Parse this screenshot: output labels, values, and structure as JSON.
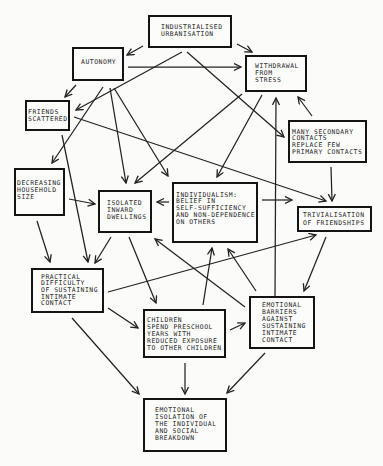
{
  "diagram": {
    "nodes": {
      "industrialised_urbanisation": {
        "label": "INDUSTRIALISED\nURBANISATION"
      },
      "autonomy": {
        "label": "AUTONOMY"
      },
      "withdrawal_from_stress": {
        "label": "WITHDRAWAL\nFROM\nSTRESS"
      },
      "friends_scattered": {
        "label": "FRIENDS\nSCATTERED"
      },
      "many_secondary_contacts": {
        "label": "MANY SECONDARY\nCONTACTS\nREPLACE FEW\nPRIMARY CONTACTS"
      },
      "decreasing_household_size": {
        "label": "DECREASING\nHOUSEHOLD\nSIZE"
      },
      "isolated_inward_dwellings": {
        "label": "ISOLATED\nINWARD\nDWELLINGS"
      },
      "individualism": {
        "label": "INDIVIDUALISM:\nBELIEF IN\nSELF-SUFFICIENCY\nAND NON-DEPENDENCE\nON OTHERS"
      },
      "trivialisation_of_friendships": {
        "label": "TRIVIALISATION\nOF FRIENDSHIPS"
      },
      "practical_difficulty": {
        "label": "PRACTICAL\nDIFFICULTY\nOF SUSTAINING\nINTIMATE\nCONTACT"
      },
      "emotional_barriers": {
        "label": "EMOTIONAL\nBARRIERS\nAGAINST\nSUSTAINING\nINTIMATE\nCONTACT"
      },
      "children_preschool": {
        "label": "CHILDREN\nSPEND PRESCHOOL\nYEARS WITH\nREDUCED EXPOSURE\nTO OTHER CHILDREN"
      },
      "emotional_isolation": {
        "label": "EMOTIONAL\nISOLATION OF\nTHE INDIVIDUAL\nAND SOCIAL\nBREAKDOWN"
      }
    },
    "edges": [
      {
        "from": "industrialised_urbanisation",
        "to": "autonomy"
      },
      {
        "from": "industrialised_urbanisation",
        "to": "withdrawal_from_stress"
      },
      {
        "from": "industrialised_urbanisation",
        "to": "friends_scattered"
      },
      {
        "from": "industrialised_urbanisation",
        "to": "many_secondary_contacts"
      },
      {
        "from": "autonomy",
        "to": "withdrawal_from_stress"
      },
      {
        "from": "autonomy",
        "to": "friends_scattered"
      },
      {
        "from": "autonomy",
        "to": "decreasing_household_size"
      },
      {
        "from": "autonomy",
        "to": "isolated_inward_dwellings"
      },
      {
        "from": "autonomy",
        "to": "individualism"
      },
      {
        "from": "withdrawal_from_stress",
        "to": "isolated_inward_dwellings"
      },
      {
        "from": "withdrawal_from_stress",
        "to": "individualism"
      },
      {
        "from": "friends_scattered",
        "to": "trivialisation_of_friendships"
      },
      {
        "from": "friends_scattered",
        "to": "practical_difficulty"
      },
      {
        "from": "many_secondary_contacts",
        "to": "withdrawal_from_stress"
      },
      {
        "from": "many_secondary_contacts",
        "to": "trivialisation_of_friendships"
      },
      {
        "from": "decreasing_household_size",
        "to": "isolated_inward_dwellings"
      },
      {
        "from": "decreasing_household_size",
        "to": "practical_difficulty"
      },
      {
        "from": "isolated_inward_dwellings",
        "to": "practical_difficulty"
      },
      {
        "from": "isolated_inward_dwellings",
        "to": "children_preschool"
      },
      {
        "from": "individualism",
        "to": "isolated_inward_dwellings"
      },
      {
        "from": "individualism",
        "to": "trivialisation_of_friendships"
      },
      {
        "from": "trivialisation_of_friendships",
        "to": "emotional_barriers"
      },
      {
        "from": "practical_difficulty",
        "to": "trivialisation_of_friendships"
      },
      {
        "from": "practical_difficulty",
        "to": "children_preschool"
      },
      {
        "from": "practical_difficulty",
        "to": "emotional_isolation"
      },
      {
        "from": "children_preschool",
        "to": "individualism"
      },
      {
        "from": "emotional_barriers",
        "to": "individualism"
      },
      {
        "from": "emotional_barriers",
        "to": "isolated_inward_dwellings"
      },
      {
        "from": "emotional_barriers",
        "to": "withdrawal_from_stress"
      },
      {
        "from": "children_preschool",
        "to": "emotional_barriers"
      },
      {
        "from": "children_preschool",
        "to": "emotional_isolation"
      },
      {
        "from": "emotional_barriers",
        "to": "emotional_isolation"
      }
    ]
  }
}
